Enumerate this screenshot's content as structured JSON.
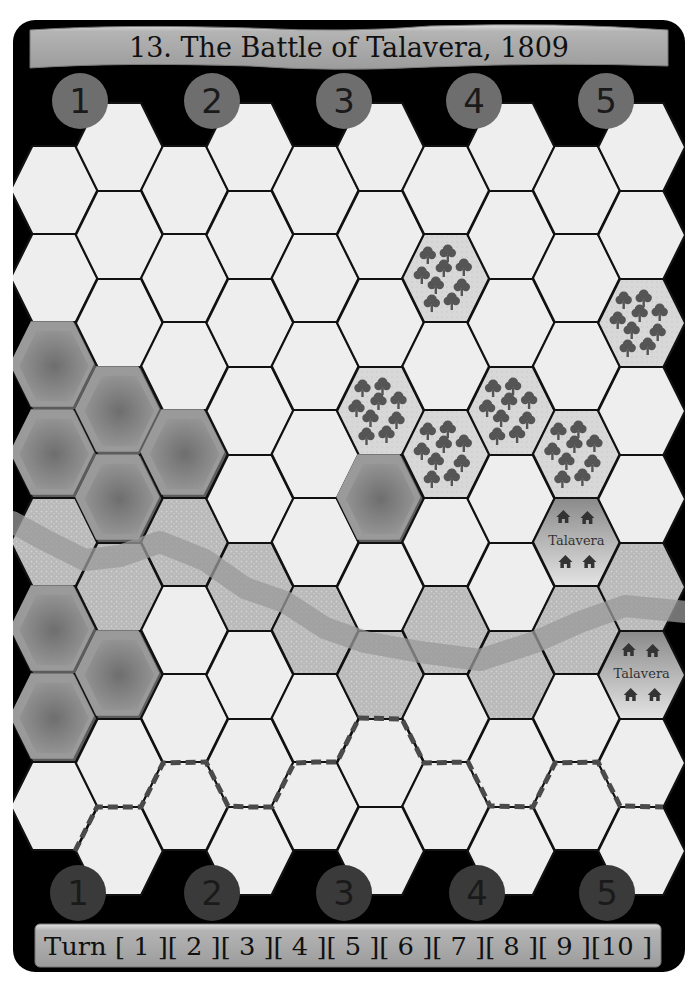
{
  "scenario": {
    "title": "13. The Battle of Talavera, 1809"
  },
  "colors": {
    "board_bg": "#000000",
    "banner": "#a9a9a9",
    "banner_highlight": "#d8d8d8",
    "hex_plain": "#eeeeee",
    "hex_line": "#111111",
    "forest_bg": "#d6d6d6",
    "tree": "#555555",
    "river_hex": "#b8b8b8",
    "river_band": "#9a9a9a",
    "hill_light": "#9a9a9a",
    "hill_dark": "#5c5c5c",
    "town_top": "#8c8c8c",
    "town_bottom": "#e2e2e2",
    "house": "#333333",
    "dash_line": "#4a4a4a",
    "top_marker": "#6e6e6e",
    "bottom_marker": "#3a3a3a"
  },
  "grid": {
    "columns": 10,
    "x0": 54,
    "col_spacing": 65.3,
    "radius": 43.5,
    "half_height": 44,
    "even_top": 146,
    "odd_top": 103,
    "even_rows": 8,
    "odd_rows": 9
  },
  "terrain": {
    "hills": [
      [
        0,
        2
      ],
      [
        0,
        3
      ],
      [
        1,
        3
      ],
      [
        1,
        4
      ],
      [
        2,
        3
      ],
      [
        5,
        4
      ],
      [
        0,
        5
      ],
      [
        1,
        6
      ],
      [
        0,
        6
      ]
    ],
    "forests": [
      [
        6,
        1
      ],
      [
        9,
        2
      ],
      [
        5,
        3
      ],
      [
        6,
        3
      ],
      [
        7,
        3
      ],
      [
        8,
        3
      ]
    ],
    "river": [
      [
        0,
        4
      ],
      [
        1,
        5
      ],
      [
        2,
        4
      ],
      [
        3,
        5
      ],
      [
        4,
        5
      ],
      [
        5,
        6
      ],
      [
        6,
        5
      ],
      [
        7,
        6
      ],
      [
        8,
        5
      ],
      [
        9,
        5
      ]
    ],
    "towns": [
      {
        "col": 8,
        "row": 4,
        "label": "Talavera"
      },
      {
        "col": 9,
        "row": 6,
        "label": "Talavera"
      }
    ]
  },
  "river_path": [
    [
      12,
      522
    ],
    [
      45,
      540
    ],
    [
      85,
      560
    ],
    [
      120,
      556
    ],
    [
      160,
      542
    ],
    [
      205,
      560
    ],
    [
      245,
      588
    ],
    [
      285,
      602
    ],
    [
      325,
      628
    ],
    [
      365,
      642
    ],
    [
      420,
      652
    ],
    [
      480,
      660
    ],
    [
      535,
      642
    ],
    [
      580,
      622
    ],
    [
      625,
      606
    ],
    [
      686,
      612
    ]
  ],
  "deployment_line": [
    [
      75,
      851
    ],
    [
      97,
      807
    ],
    [
      141,
      807
    ],
    [
      163,
      763
    ],
    [
      206,
      762
    ],
    [
      228,
      806
    ],
    [
      250,
      807
    ],
    [
      272,
      807
    ],
    [
      294,
      763
    ],
    [
      315,
      762
    ],
    [
      337,
      762
    ],
    [
      359,
      718
    ],
    [
      402,
      719
    ],
    [
      424,
      763
    ],
    [
      468,
      762
    ],
    [
      490,
      806
    ],
    [
      533,
      807
    ],
    [
      555,
      763
    ],
    [
      598,
      762
    ],
    [
      620,
      806
    ],
    [
      663,
      807
    ]
  ],
  "section_markers": {
    "top": [
      {
        "label": "1",
        "x": 80,
        "y": 101
      },
      {
        "label": "2",
        "x": 212,
        "y": 101
      },
      {
        "label": "3",
        "x": 344,
        "y": 101
      },
      {
        "label": "4",
        "x": 474,
        "y": 101
      },
      {
        "label": "5",
        "x": 606,
        "y": 101
      }
    ],
    "bottom": [
      {
        "label": "1",
        "x": 78,
        "y": 893
      },
      {
        "label": "2",
        "x": 212,
        "y": 893
      },
      {
        "label": "3",
        "x": 344,
        "y": 893
      },
      {
        "label": "4",
        "x": 477,
        "y": 893
      },
      {
        "label": "5",
        "x": 607,
        "y": 893
      }
    ]
  },
  "turn_track": {
    "label": "Turn",
    "text": "Turn [ 1 ][ 2 ][ 3 ][ 4 ][ 5 ][ 6 ][ 7 ][ 8 ][ 9 ][10 ]",
    "turns": [
      "1",
      "2",
      "3",
      "4",
      "5",
      "6",
      "7",
      "8",
      "9",
      "10"
    ]
  }
}
